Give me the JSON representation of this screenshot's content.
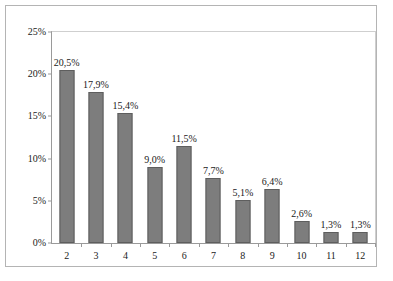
{
  "chart_data": {
    "type": "bar",
    "title": "",
    "subtitle": "",
    "xlabel": "",
    "ylabel": "",
    "categories": [
      "2",
      "3",
      "4",
      "5",
      "6",
      "7",
      "8",
      "9",
      "10",
      "11",
      "12"
    ],
    "values": [
      20.5,
      17.9,
      15.4,
      9.0,
      11.5,
      7.7,
      5.1,
      6.4,
      2.6,
      1.3,
      1.3
    ],
    "data_labels": [
      "20,5%",
      "17,9%",
      "15,4%",
      "9,0%",
      "11,5%",
      "7,7%",
      "5,1%",
      "6,4%",
      "2,6%",
      "1,3%",
      "1,3%"
    ],
    "ylim": [
      0,
      25
    ],
    "ytick_values": [
      0,
      5,
      10,
      15,
      20,
      25
    ],
    "ytick_labels": [
      "0%",
      "5%",
      "10%",
      "15%",
      "20%",
      "25%"
    ],
    "xtick_labels": [
      "2",
      "3",
      "4",
      "5",
      "6",
      "7",
      "8",
      "9",
      "10",
      "11",
      "12"
    ],
    "grid": false,
    "legend": null,
    "legend_position": "none",
    "bar_color": "#7d7d7d",
    "bar_edge_color": "#5e5e5e",
    "axis_color": "#9a9a9a",
    "plot_border_color": "#cfcfcf",
    "frame_color": "#b4b4b4",
    "background_color": "#ffffff",
    "text_color": "#1a1a1a",
    "decimal_separator": ","
  }
}
